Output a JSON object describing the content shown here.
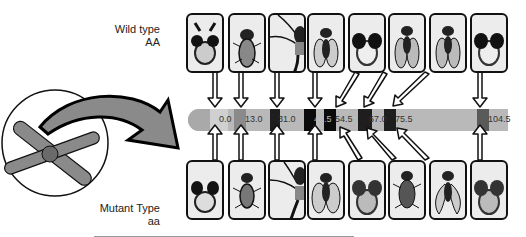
{
  "labels": {
    "wild_title": "Wild type",
    "wild_geno": "AA",
    "mutant_title": "Mutant Type",
    "mutant_geno": "aa"
  },
  "chromosome": {
    "markers": [
      "0.0",
      "13.0",
      "31.0",
      "48.5",
      "54.5",
      "67.0",
      "75.5",
      "104.5"
    ]
  },
  "colors": {
    "bar": "#b9b9b9",
    "bar_cap": "#a9a9a9",
    "arrow": "#8e8e8e",
    "box": "#ececec",
    "band_light": "#d0d0d0",
    "band_mid": "#8a8a8a",
    "band_dark": "#1e1e1e",
    "band_black": "#0b0b0b"
  },
  "panels": {
    "wild": [
      "eye-antenna head",
      "fly body",
      "leg",
      "fly wings",
      "eye head",
      "fly",
      "fly",
      "eye head"
    ],
    "mutant": [
      "eye head",
      "fly body",
      "leg",
      "fly wings",
      "eye head",
      "fly",
      "fly curled wings",
      "eye head"
    ]
  }
}
